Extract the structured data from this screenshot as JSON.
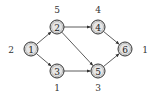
{
  "diagram": {
    "type": "directed-graph",
    "nodes": [
      {
        "id": "1",
        "label": "1",
        "x": 31,
        "y": 49,
        "weight": "2",
        "wx": 11,
        "wy": 50
      },
      {
        "id": "2",
        "label": "2",
        "x": 57,
        "y": 27,
        "weight": "5",
        "wx": 57,
        "wy": 10
      },
      {
        "id": "3",
        "label": "3",
        "x": 57,
        "y": 71,
        "weight": "1",
        "wx": 57,
        "wy": 88
      },
      {
        "id": "4",
        "label": "4",
        "x": 98,
        "y": 27,
        "weight": "4",
        "wx": 98,
        "wy": 10
      },
      {
        "id": "5",
        "label": "5",
        "x": 98,
        "y": 71,
        "weight": "3",
        "wx": 98,
        "wy": 88
      },
      {
        "id": "6",
        "label": "6",
        "x": 125,
        "y": 49,
        "weight": "1",
        "wx": 145,
        "wy": 50
      }
    ],
    "edges": [
      {
        "from": "1",
        "to": "2"
      },
      {
        "from": "1",
        "to": "3"
      },
      {
        "from": "2",
        "to": "4"
      },
      {
        "from": "2",
        "to": "5"
      },
      {
        "from": "3",
        "to": "5"
      },
      {
        "from": "4",
        "to": "6"
      },
      {
        "from": "5",
        "to": "6"
      }
    ],
    "colors": {
      "node_fill": "#e6e6e6",
      "node_stroke": "#333333",
      "edge": "#333333",
      "text": "#222222"
    }
  }
}
